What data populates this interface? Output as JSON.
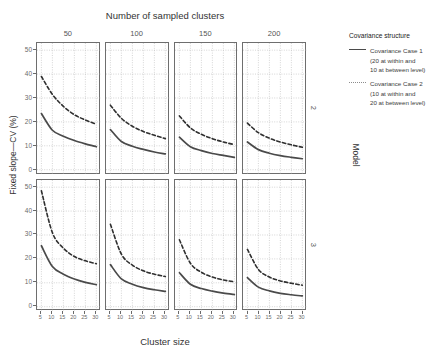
{
  "chart_data": {
    "type": "line",
    "title": "Number of sampled clusters",
    "xlabel": "Cluster size",
    "ylabel": "Fixed slope—CV (%)",
    "facet_col_label": "Number of sampled clusters",
    "facet_row_label": "Model",
    "facet_cols": [
      "50",
      "100",
      "150",
      "200"
    ],
    "facet_rows": [
      "2",
      "3"
    ],
    "x": [
      5,
      10,
      15,
      20,
      25,
      30
    ],
    "xlim": [
      3,
      32
    ],
    "ylim": [
      -2,
      53
    ],
    "xticks": [
      "5",
      "10",
      "15",
      "20",
      "25",
      "30"
    ],
    "yticks": [
      "0",
      "10",
      "20",
      "30",
      "40",
      "50"
    ],
    "grid": true,
    "legend_position": "right",
    "legend_title": "Covariance structure",
    "series_names": [
      "Covariance Case 1",
      "Covariance Case 2"
    ],
    "panels": [
      {
        "row": "2",
        "col": "50",
        "series": [
          {
            "name": "Covariance Case 1",
            "style": "solid",
            "values": [
              23.5,
              16.5,
              14.0,
              12.2,
              10.8,
              9.6
            ]
          },
          {
            "name": "Covariance Case 2",
            "style": "dashed",
            "values": [
              39.0,
              31.5,
              26.5,
              23.0,
              20.8,
              19.0
            ]
          }
        ]
      },
      {
        "row": "2",
        "col": "100",
        "series": [
          {
            "name": "Covariance Case 1",
            "style": "solid",
            "values": [
              16.8,
              11.8,
              9.8,
              8.5,
              7.4,
              6.6
            ]
          },
          {
            "name": "Covariance Case 2",
            "style": "dashed",
            "values": [
              27.0,
              21.5,
              18.2,
              16.0,
              14.4,
              13.0
            ]
          }
        ]
      },
      {
        "row": "2",
        "col": "150",
        "series": [
          {
            "name": "Covariance Case 1",
            "style": "solid",
            "values": [
              13.6,
              9.6,
              8.0,
              6.8,
              6.0,
              5.2
            ]
          },
          {
            "name": "Covariance Case 2",
            "style": "dashed",
            "values": [
              22.5,
              17.5,
              14.8,
              13.0,
              11.6,
              10.5
            ]
          }
        ]
      },
      {
        "row": "2",
        "col": "200",
        "series": [
          {
            "name": "Covariance Case 1",
            "style": "solid",
            "values": [
              11.6,
              8.4,
              6.9,
              5.9,
              5.2,
              4.6
            ]
          },
          {
            "name": "Covariance Case 2",
            "style": "dashed",
            "values": [
              19.5,
              15.5,
              13.2,
              11.6,
              10.4,
              9.4
            ]
          }
        ]
      },
      {
        "row": "3",
        "col": "50",
        "series": [
          {
            "name": "Covariance Case 1",
            "style": "solid",
            "values": [
              25.5,
              16.8,
              13.6,
              11.6,
              10.2,
              9.2
            ]
          },
          {
            "name": "Covariance Case 2",
            "style": "dashed",
            "values": [
              48.5,
              31.0,
              24.5,
              21.0,
              19.2,
              18.0
            ]
          }
        ]
      },
      {
        "row": "3",
        "col": "100",
        "series": [
          {
            "name": "Covariance Case 1",
            "style": "solid",
            "values": [
              17.6,
              11.6,
              9.4,
              8.0,
              7.1,
              6.4
            ]
          },
          {
            "name": "Covariance Case 2",
            "style": "dashed",
            "values": [
              34.5,
              22.0,
              17.4,
              15.0,
              13.6,
              12.6
            ]
          }
        ]
      },
      {
        "row": "3",
        "col": "150",
        "series": [
          {
            "name": "Covariance Case 1",
            "style": "solid",
            "values": [
              14.2,
              9.4,
              7.6,
              6.5,
              5.7,
              5.1
            ]
          },
          {
            "name": "Covariance Case 2",
            "style": "dashed",
            "values": [
              28.0,
              18.2,
              14.4,
              12.4,
              11.2,
              10.4
            ]
          }
        ]
      },
      {
        "row": "3",
        "col": "200",
        "series": [
          {
            "name": "Covariance Case 1",
            "style": "solid",
            "values": [
              12.2,
              8.2,
              6.6,
              5.6,
              5.0,
              4.5
            ]
          },
          {
            "name": "Covariance Case 2",
            "style": "dashed",
            "values": [
              24.0,
              15.6,
              12.4,
              10.8,
              9.8,
              9.0
            ]
          }
        ]
      }
    ]
  },
  "legend": {
    "title": "Covariance structure",
    "entries": [
      {
        "style": "solid",
        "lines": [
          "Covariance Case 1",
          "(20 at within and",
          "10 at between level)"
        ]
      },
      {
        "style": "dashed",
        "lines": [
          "Covariance Case 2",
          "(10 at within and",
          "20 at between level)"
        ]
      }
    ]
  },
  "colors": {
    "case1": "#4a4a4a",
    "case2": "#8c8c8c",
    "panel_border": "#6e6e6e",
    "grid": "#b8b8b8",
    "text": "#3c3c3c"
  }
}
